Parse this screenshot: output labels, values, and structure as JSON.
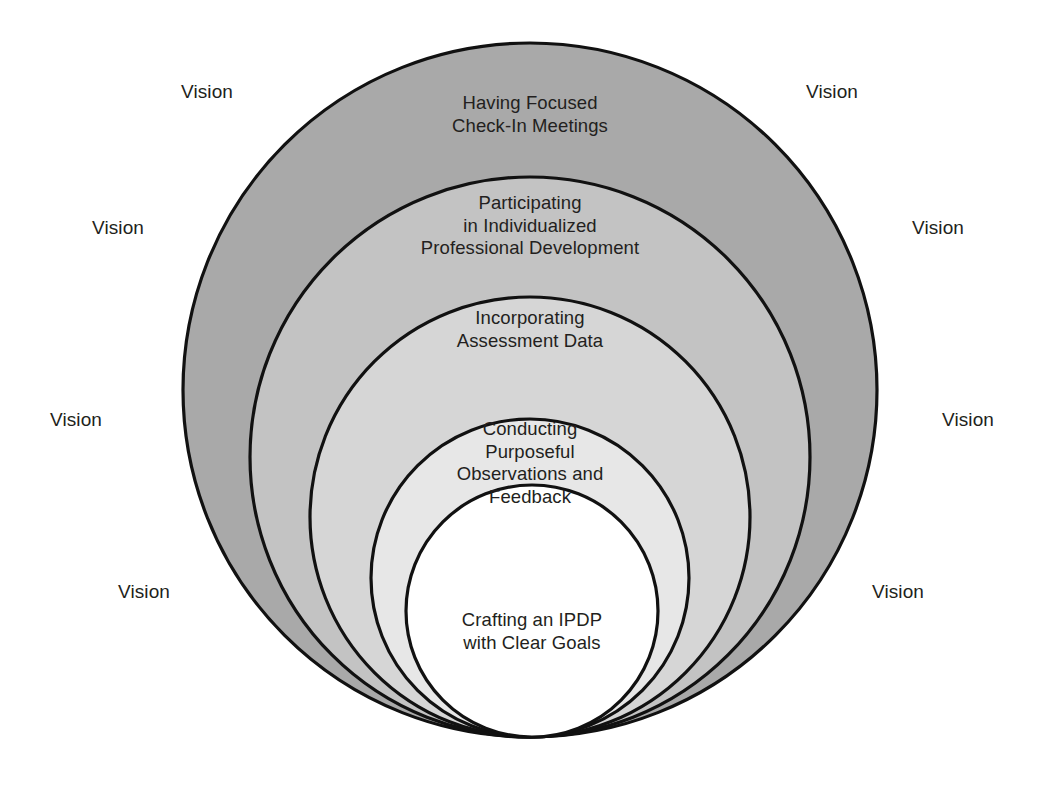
{
  "diagram": {
    "type": "nested-tangent-circles",
    "canvas": {
      "width": 1046,
      "height": 801
    },
    "background_color": "#ffffff",
    "stroke_color": "#111111",
    "text_color": "#231f20",
    "rings": [
      {
        "id": "ring-1",
        "label": "Having Focused\nCheck-In Meetings",
        "fill": "#a9a9a9",
        "cx": 530,
        "cy": 390,
        "r": 347,
        "label_x": 530,
        "label_y": 92
      },
      {
        "id": "ring-2",
        "label": "Participating\nin Individualized\nProfessional Development",
        "fill": "#c3c3c3",
        "cx": 530,
        "cy": 457,
        "r": 280,
        "label_x": 530,
        "label_y": 192
      },
      {
        "id": "ring-3",
        "label": "Incorporating\nAssessment Data",
        "fill": "#d6d6d6",
        "cx": 530,
        "cy": 517,
        "r": 220,
        "label_x": 530,
        "label_y": 307
      },
      {
        "id": "ring-4",
        "label": "Conducting\nPurposeful\nObservations and\nFeedback",
        "fill": "#e7e7e7",
        "cx": 530,
        "cy": 578,
        "r": 159,
        "label_x": 530,
        "label_y": 418
      },
      {
        "id": "ring-5",
        "label": "Crafting an IPDP\nwith Clear Goals",
        "fill": "#ffffff",
        "cx": 532,
        "cy": 611,
        "r": 126,
        "label_x": 532,
        "label_y": 609
      }
    ],
    "vision_labels": [
      {
        "text": "Vision",
        "x": 207,
        "y": 92
      },
      {
        "text": "Vision",
        "x": 118,
        "y": 228
      },
      {
        "text": "Vision",
        "x": 76,
        "y": 420
      },
      {
        "text": "Vision",
        "x": 144,
        "y": 592
      },
      {
        "text": "Vision",
        "x": 832,
        "y": 92
      },
      {
        "text": "Vision",
        "x": 938,
        "y": 228
      },
      {
        "text": "Vision",
        "x": 968,
        "y": 420
      },
      {
        "text": "Vision",
        "x": 898,
        "y": 592
      }
    ]
  }
}
